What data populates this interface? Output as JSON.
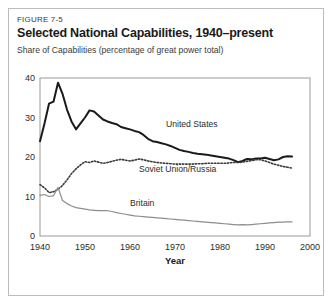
{
  "figure": {
    "number": "FIGURE 7-5",
    "title": "Selected National Capabilities, 1940–present",
    "subtitle": "Share of Capabilities (percentage of great power total)"
  },
  "chart_data": {
    "type": "line",
    "title": "Selected National Capabilities, 1940–present",
    "subtitle": "Share of Capabilities (percentage of great power total)",
    "xlabel": "Year",
    "ylabel": "Share of Capabilities (percentage of great power total)",
    "xlim": [
      1940,
      2000
    ],
    "ylim": [
      0,
      40
    ],
    "xticks": [
      1940,
      1950,
      1960,
      1970,
      1980,
      1990,
      2000
    ],
    "yticks": [
      0,
      10,
      20,
      30,
      40
    ],
    "grid": false,
    "legend": "inline-labels",
    "series": [
      {
        "name": "United States",
        "style": "solid-thick",
        "color": "#1a1a1a",
        "label_x": 1968,
        "label_y": 27.5,
        "x": [
          1940,
          1941,
          1942,
          1943,
          1944,
          1945,
          1946,
          1947,
          1948,
          1949,
          1950,
          1951,
          1952,
          1953,
          1954,
          1955,
          1956,
          1957,
          1958,
          1959,
          1960,
          1961,
          1962,
          1963,
          1964,
          1965,
          1966,
          1967,
          1968,
          1969,
          1970,
          1971,
          1972,
          1973,
          1974,
          1975,
          1976,
          1977,
          1978,
          1979,
          1980,
          1981,
          1982,
          1983,
          1984,
          1985,
          1986,
          1987,
          1988,
          1989,
          1990,
          1991,
          1992,
          1993,
          1994,
          1995,
          1996
        ],
        "values": [
          24.0,
          28.5,
          33.5,
          34.0,
          38.8,
          36.0,
          32.0,
          29.0,
          27.0,
          28.5,
          30.0,
          31.8,
          31.5,
          30.5,
          29.5,
          29.0,
          28.6,
          28.3,
          27.6,
          27.3,
          27.0,
          26.6,
          26.3,
          25.6,
          24.6,
          24.0,
          23.8,
          23.5,
          23.2,
          22.8,
          22.3,
          21.8,
          21.5,
          21.3,
          21.0,
          20.8,
          20.7,
          20.6,
          20.4,
          20.2,
          20.0,
          19.8,
          19.6,
          19.2,
          18.7,
          19.0,
          19.5,
          19.4,
          19.6,
          19.6,
          19.8,
          19.5,
          19.2,
          19.4,
          20.0,
          20.2,
          20.1
        ]
      },
      {
        "name": "Soviet Union/Russia",
        "style": "dotted",
        "color": "#3a3a3a",
        "label_x": 1962,
        "label_y": 16.2,
        "x": [
          1940,
          1941,
          1942,
          1943,
          1944,
          1945,
          1946,
          1947,
          1948,
          1949,
          1950,
          1951,
          1952,
          1953,
          1954,
          1955,
          1956,
          1957,
          1958,
          1959,
          1960,
          1961,
          1962,
          1963,
          1964,
          1965,
          1966,
          1967,
          1968,
          1969,
          1970,
          1971,
          1972,
          1973,
          1974,
          1975,
          1976,
          1977,
          1978,
          1979,
          1980,
          1981,
          1982,
          1983,
          1984,
          1985,
          1986,
          1987,
          1988,
          1989,
          1990,
          1991,
          1992,
          1993,
          1994,
          1995,
          1996
        ],
        "values": [
          13.0,
          12.2,
          11.0,
          11.2,
          11.8,
          12.8,
          14.2,
          15.8,
          17.0,
          18.0,
          18.8,
          18.6,
          19.0,
          18.7,
          18.4,
          18.6,
          18.9,
          19.2,
          19.4,
          19.2,
          19.0,
          19.2,
          19.5,
          19.3,
          19.0,
          18.8,
          18.6,
          18.5,
          18.4,
          18.3,
          18.2,
          18.2,
          18.2,
          18.2,
          18.2,
          18.3,
          18.3,
          18.4,
          18.4,
          18.4,
          18.4,
          18.4,
          18.5,
          18.6,
          18.6,
          18.7,
          18.9,
          19.1,
          19.3,
          19.3,
          19.0,
          18.6,
          18.2,
          17.9,
          17.6,
          17.4,
          17.2
        ]
      },
      {
        "name": "Britain",
        "style": "solid-thin",
        "color": "#8d8d8d",
        "label_x": 1960,
        "label_y": 7.5,
        "x": [
          1940,
          1941,
          1942,
          1943,
          1944,
          1945,
          1946,
          1947,
          1948,
          1949,
          1950,
          1951,
          1952,
          1953,
          1954,
          1955,
          1956,
          1957,
          1958,
          1959,
          1960,
          1961,
          1962,
          1963,
          1964,
          1965,
          1966,
          1967,
          1968,
          1969,
          1970,
          1971,
          1972,
          1973,
          1974,
          1975,
          1976,
          1977,
          1978,
          1979,
          1980,
          1981,
          1982,
          1983,
          1984,
          1985,
          1986,
          1987,
          1988,
          1989,
          1990,
          1991,
          1992,
          1993,
          1994,
          1995,
          1996
        ],
        "values": [
          10.3,
          10.5,
          10.0,
          10.2,
          12.3,
          9.0,
          8.2,
          7.6,
          7.2,
          7.0,
          6.8,
          6.6,
          6.5,
          6.4,
          6.4,
          6.4,
          6.2,
          5.9,
          5.7,
          5.5,
          5.3,
          5.1,
          5.0,
          4.9,
          4.8,
          4.7,
          4.6,
          4.5,
          4.4,
          4.3,
          4.2,
          4.1,
          4.0,
          3.9,
          3.8,
          3.7,
          3.6,
          3.5,
          3.4,
          3.3,
          3.2,
          3.1,
          3.0,
          2.9,
          2.8,
          2.9,
          2.8,
          2.9,
          3.0,
          3.1,
          3.2,
          3.3,
          3.4,
          3.5,
          3.5,
          3.6,
          3.6
        ]
      }
    ]
  }
}
